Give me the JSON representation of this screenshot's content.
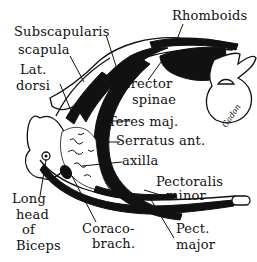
{
  "diagram": {
    "labels": {
      "subscapularis": "Subscapularis",
      "rhomboids": "Rhomboids",
      "scapula": "scapula",
      "lat_dorsi_1": "Lat.",
      "lat_dorsi_2": "dorsi",
      "erector_1": "Erector",
      "erector_2": "spinae",
      "teres_maj": "Teres maj.",
      "serratus_ant": "Serratus ant.",
      "axilla": "axilla",
      "pect_minor_1": "Pectoralis",
      "pect_minor_2": "minor",
      "long_head_1": "Long",
      "long_head_2": "head",
      "long_head_3": "of",
      "long_head_4": "Biceps",
      "coraco_1": "Coraco-",
      "coraco_2": "brach.",
      "pect_major_1": "Pect.",
      "pect_major_2": "major"
    },
    "signature": "Gadon",
    "colors": {
      "ink": "#111111",
      "paper": "#ffffff"
    }
  }
}
